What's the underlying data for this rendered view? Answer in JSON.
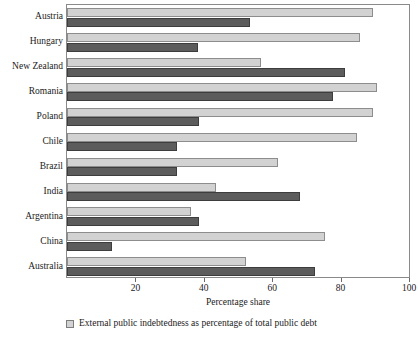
{
  "chart_data": {
    "type": "bar",
    "orientation": "horizontal",
    "title": "",
    "xlabel": "Percentage share",
    "ylabel": "",
    "xlim": [
      0,
      100
    ],
    "xticks": [
      20,
      40,
      60,
      80,
      100
    ],
    "grid": false,
    "legend_position": "bottom-left",
    "categories": [
      "Austria",
      "Hungary",
      "New Zealand",
      "Romania",
      "Poland",
      "Chile",
      "Brazil",
      "India",
      "Argentina",
      "China",
      "Australia"
    ],
    "series": [
      {
        "name": "External public indebtedness as percentage of total public debt",
        "color": "#d2d2d2",
        "values": [
          89.5,
          85.7,
          56.8,
          90.6,
          89.5,
          84.8,
          61.8,
          43.7,
          36.4,
          75.3,
          52.2
        ]
      },
      {
        "name": "Second series",
        "color": "#5c5c5c",
        "values": [
          53.6,
          38.2,
          81.3,
          77.8,
          38.5,
          32.1,
          32.3,
          68.0,
          38.5,
          13.3,
          72.6
        ]
      }
    ]
  },
  "legend": {
    "items": [
      {
        "label": "External public indebtedness as percentage of total public debt",
        "color": "#d2d2d2"
      }
    ]
  },
  "axis": {
    "x_title": "Percentage share",
    "tick_labels": [
      "20",
      "40",
      "60",
      "80",
      "100"
    ]
  }
}
